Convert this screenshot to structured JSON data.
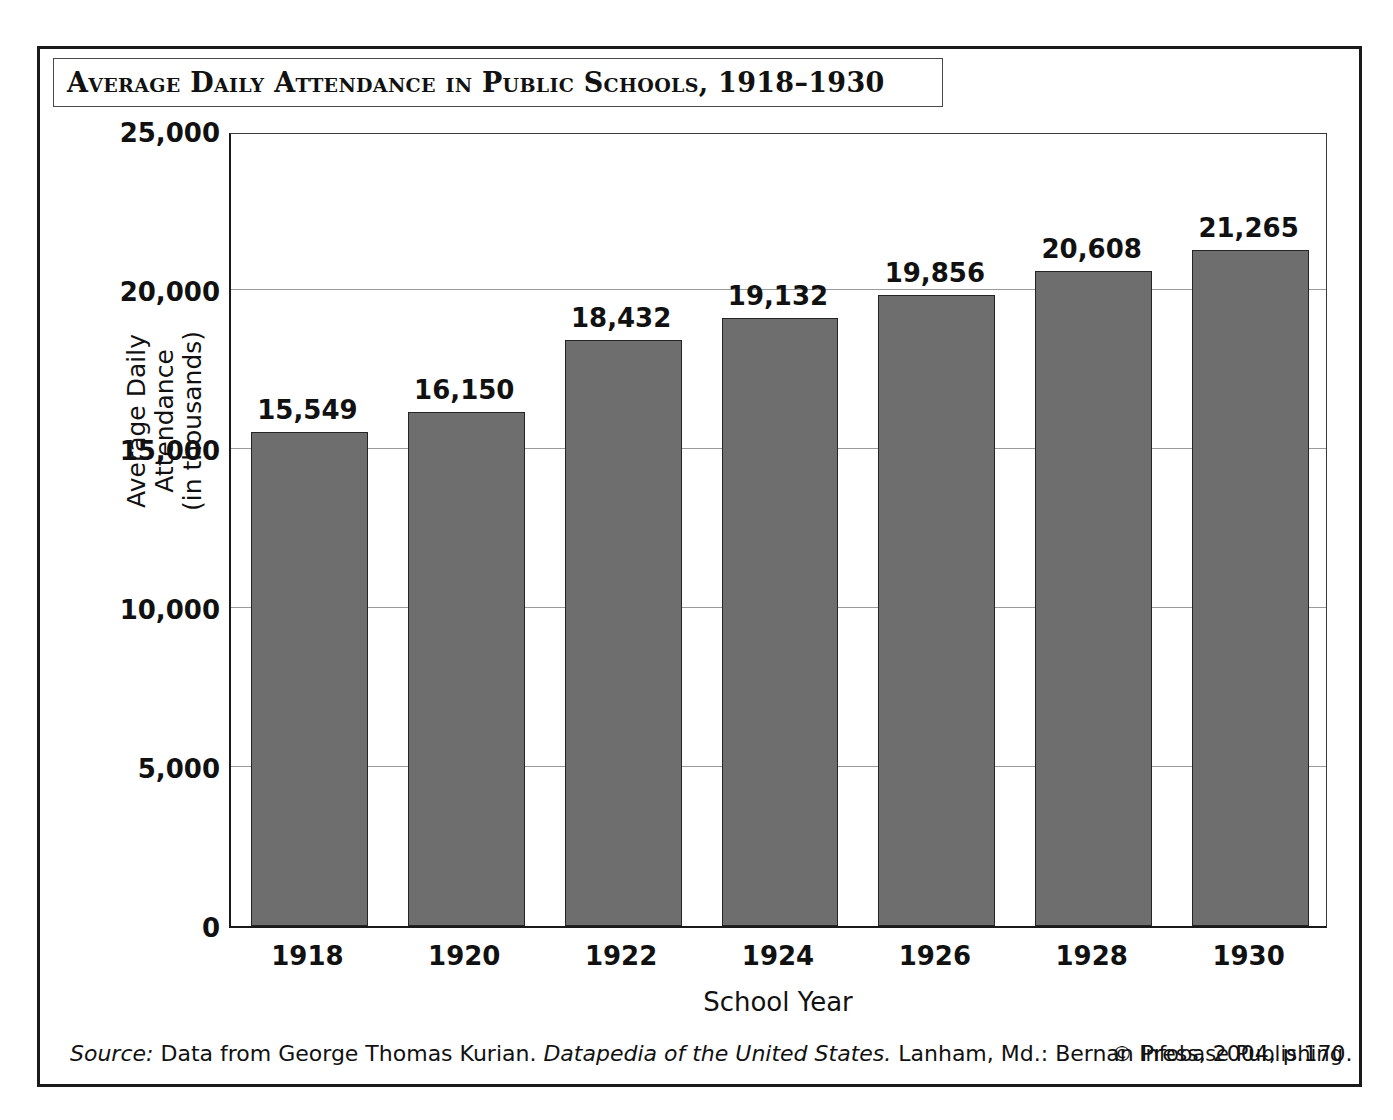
{
  "figure": {
    "title": "Average Daily Attendance in Public Schools, 1918–1930",
    "source_label": "Source:",
    "source_text_1": " Data from George Thomas Kurian. ",
    "source_italic_title": "Datapedia of the United States.",
    "source_text_2": " Lanham, Md.: Bernan Press, 2004, p.170.",
    "credit": "© Infobase Publishing"
  },
  "chart_data": {
    "type": "bar",
    "title": "Average Daily Attendance in Public Schools, 1918–1930",
    "categories": [
      "1918",
      "1920",
      "1922",
      "1924",
      "1926",
      "1928",
      "1930"
    ],
    "values": [
      15549,
      16150,
      18432,
      19132,
      19856,
      20608,
      21265
    ],
    "value_labels": [
      "15,549",
      "16,150",
      "18,432",
      "19,132",
      "19,856",
      "20,608",
      "21,265"
    ],
    "xlabel": "School Year",
    "ylabel": "Average Daily Attendance\n(in thousands)",
    "ylabel_line1": "Average Daily Attendance",
    "ylabel_line2": "(in thousands)",
    "ylim": [
      0,
      25000
    ],
    "yticks": [
      0,
      5000,
      10000,
      15000,
      20000,
      25000
    ],
    "ytick_labels": [
      "0",
      "5,000",
      "10,000",
      "15,000",
      "20,000",
      "25,000"
    ],
    "grid": true,
    "grid_axis": "y",
    "legend": false,
    "bar_color": "#6e6e6e",
    "bar_edge_color": "#242424",
    "background_color": "#ffffff"
  }
}
